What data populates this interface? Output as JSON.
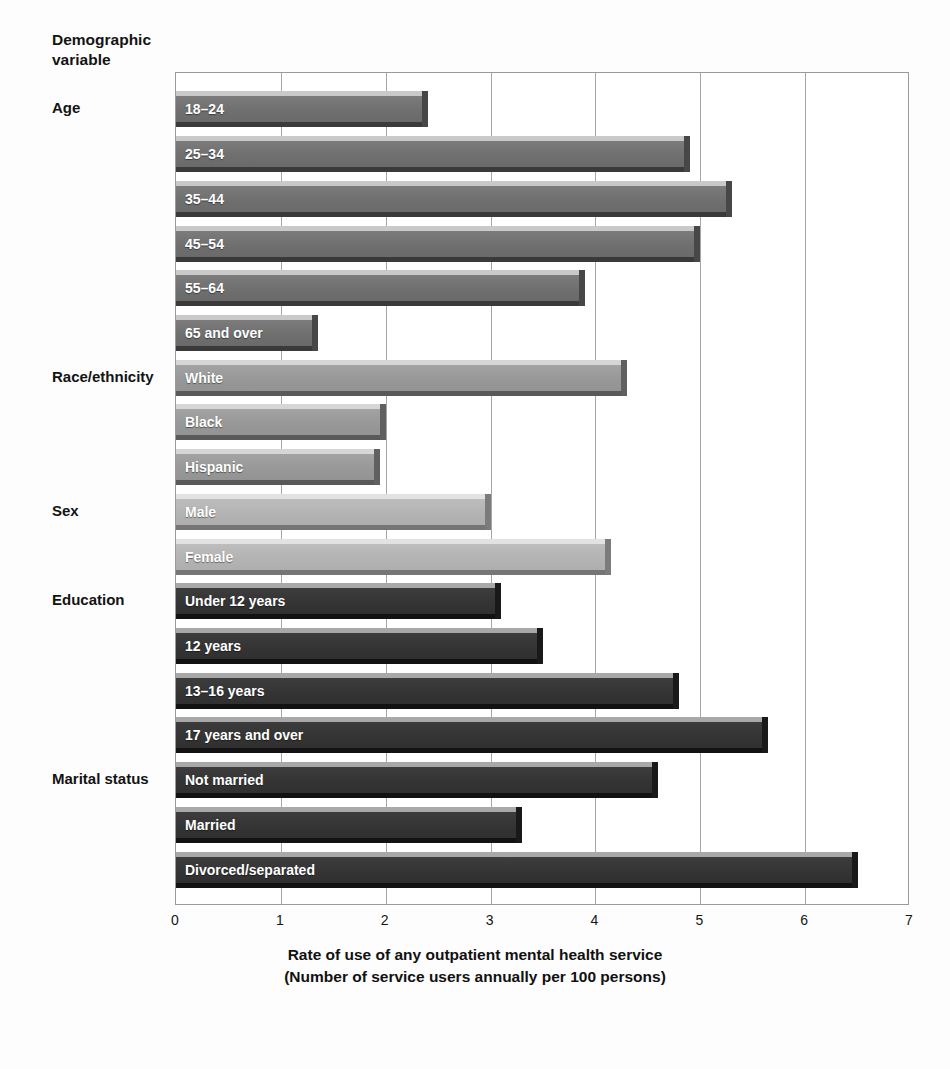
{
  "page": {
    "cutoff_text_fragment": "",
    "demographic_header_line1": "Demographic",
    "demographic_header_line2": "variable"
  },
  "axis": {
    "title_line1": "Rate of use of any outpatient mental health service",
    "title_line2": "(Number of service users annually per 100 persons)",
    "ticks": [
      "0",
      "1",
      "2",
      "3",
      "4",
      "5",
      "6",
      "7"
    ]
  },
  "groups": [
    {
      "name": "Age",
      "label": "Age"
    },
    {
      "name": "Race/ethnicity",
      "label": "Race/ethnicity"
    },
    {
      "name": "Sex",
      "label": "Sex"
    },
    {
      "name": "Education",
      "label": "Education"
    },
    {
      "name": "Marital status",
      "label": "Marital status"
    }
  ],
  "chart_data": {
    "type": "bar",
    "orientation": "horizontal",
    "title": "",
    "subtitle": "",
    "xlabel": "Rate of use of any outpatient mental health service (Number of service users annually per 100 persons)",
    "ylabel": "Demographic variable",
    "xlim": [
      0,
      7
    ],
    "xticks": [
      0,
      1,
      2,
      3,
      4,
      5,
      6,
      7
    ],
    "grid": true,
    "legend": "none",
    "categories": [
      "18–24",
      "25–34",
      "35–44",
      "45–54",
      "55–64",
      "65 and over",
      "White",
      "Black",
      "Hispanic",
      "Male",
      "Female",
      "Under 12 years",
      "12 years",
      "13–16 years",
      "17 years and over",
      "Not married",
      "Married",
      "Divorced/separated"
    ],
    "values": [
      2.4,
      4.9,
      5.3,
      5.0,
      3.9,
      1.35,
      4.3,
      2.0,
      1.95,
      3.0,
      4.15,
      3.1,
      3.5,
      4.8,
      5.65,
      4.6,
      3.3,
      6.5
    ],
    "groups": [
      "Age",
      "Age",
      "Age",
      "Age",
      "Age",
      "Age",
      "Race/ethnicity",
      "Race/ethnicity",
      "Race/ethnicity",
      "Sex",
      "Sex",
      "Education",
      "Education",
      "Education",
      "Education",
      "Marital status",
      "Marital status",
      "Marital status"
    ],
    "tones": [
      "tone-a",
      "tone-a",
      "tone-a",
      "tone-a",
      "tone-a",
      "tone-a",
      "tone-b",
      "tone-b",
      "tone-b",
      "tone-c",
      "tone-c",
      "tone-d",
      "tone-d",
      "tone-d",
      "tone-d",
      "tone-d",
      "tone-d",
      "tone-d"
    ]
  },
  "colors": {
    "bar_age": "#6f6f6f",
    "bar_race": "#989898",
    "bar_sex": "#b3b3b3",
    "bar_education": "#343434",
    "grid": "#a6a6a6",
    "frame": "#9a9a9a",
    "background": "#ffffff",
    "text": "#111111",
    "bar_label_text": "#ffffff"
  }
}
